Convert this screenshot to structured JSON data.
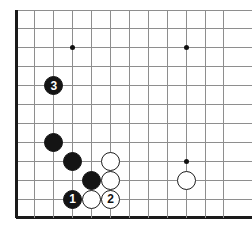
{
  "figure": {
    "kind": "go-board-diagram",
    "board_colors": {
      "background": "#ffffff",
      "grid_line": "#8e8e8e",
      "edge_line": "#1a1a1a",
      "black_stone": "#141414",
      "white_stone": "#ffffff",
      "white_stone_outline": "#1c1c1c",
      "star_point": "#111111"
    },
    "grid": {
      "columns": 12,
      "rows": 12,
      "origin_x": 16,
      "origin_y": 10,
      "spacing_x": 18.9,
      "spacing_y": 18.9,
      "edges": [
        "left",
        "bottom"
      ]
    },
    "star_points": [
      {
        "col": 4,
        "row": 3
      },
      {
        "col": 10,
        "row": 3
      },
      {
        "col": 10,
        "row": 9
      }
    ],
    "stones": [
      {
        "col": 3,
        "row": 5,
        "color": "black",
        "label": "3"
      },
      {
        "col": 3,
        "row": 8,
        "color": "black",
        "label": ""
      },
      {
        "col": 4,
        "row": 9,
        "color": "black",
        "label": ""
      },
      {
        "col": 5,
        "row": 10,
        "color": "black",
        "label": ""
      },
      {
        "col": 4,
        "row": 11,
        "color": "black",
        "label": "1"
      },
      {
        "col": 6,
        "row": 9,
        "color": "white",
        "label": ""
      },
      {
        "col": 6,
        "row": 10,
        "color": "white",
        "label": ""
      },
      {
        "col": 5,
        "row": 11,
        "color": "white",
        "label": ""
      },
      {
        "col": 6,
        "row": 11,
        "color": "white",
        "label": "2"
      },
      {
        "col": 10,
        "row": 10,
        "color": "white",
        "label": ""
      }
    ],
    "move_numbers": [
      "1",
      "2",
      "3"
    ]
  }
}
